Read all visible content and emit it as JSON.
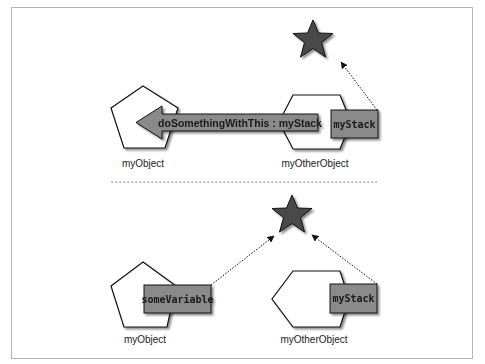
{
  "colors": {
    "frame_border": "#b5b5b5",
    "shape_fill": "#ffffff",
    "shape_stroke": "#111111",
    "star_fill": "#4a4a4a",
    "box_fill": "#8a8a8a",
    "divider": "#777777"
  },
  "top_panel": {
    "star": {
      "icon": "star-icon"
    },
    "my_object_label": "myObject",
    "my_other_object_label": "myOtherObject",
    "message_arrow_label": "doSomethingWithThis : myStack",
    "property_box_label": "myStack"
  },
  "bottom_panel": {
    "star": {
      "icon": "star-icon"
    },
    "my_object_label": "myObject",
    "my_other_object_label": "myOtherObject",
    "left_property_box_label": "someVariable",
    "right_property_box_label": "myStack"
  }
}
